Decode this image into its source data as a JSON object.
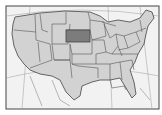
{
  "map": {
    "title": "United States",
    "highlighted_state": "South Dakota",
    "colors": {
      "background": "#f2f2f2",
      "state_fill": "#d2d2d2",
      "highlight_fill": "#7c7c7c",
      "border": "#555555",
      "graticule": "#9a9a9a",
      "frame": "#444444"
    }
  }
}
